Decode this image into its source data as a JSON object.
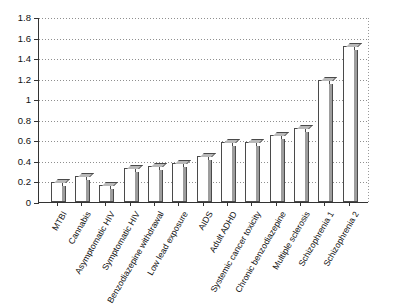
{
  "chart_data": {
    "type": "bar",
    "title": "",
    "xlabel": "",
    "ylabel": "",
    "ylim": [
      0,
      1.8
    ],
    "yticks": [
      "0",
      "0.2",
      "0.4",
      "0.6",
      "0.8",
      "1",
      "1.2",
      "1.4",
      "1.6",
      "1.8"
    ],
    "ytick_values": [
      0,
      0.2,
      0.4,
      0.6,
      0.8,
      1,
      1.2,
      1.4,
      1.6,
      1.8
    ],
    "grid": true,
    "legend": "none",
    "categories": [
      "MTBI",
      "Cannabis",
      "Asymptomatic HIV",
      "Symptomatic HIV",
      "Benzodiazepine withdrawal",
      "Low lead exposure",
      "AIDS",
      "Adult ADHD",
      "Systemic cancer toxicity",
      "Chronic benzodiazepine",
      "Multiple sclerosis",
      "Schizophrenia 1",
      "Schizophrenia 2"
    ],
    "values": [
      0.19,
      0.25,
      0.17,
      0.33,
      0.35,
      0.38,
      0.45,
      0.58,
      0.58,
      0.65,
      0.72,
      1.19,
      1.52
    ],
    "bars": [
      {
        "label": "MTBI",
        "value": 0.19
      },
      {
        "label": "Cannabis",
        "value": 0.25
      },
      {
        "label": "Asymptomatic HIV",
        "value": 0.17
      },
      {
        "label": "Symptomatic HIV",
        "value": 0.33
      },
      {
        "label": "Benzodiazepine withdrawal",
        "value": 0.35
      },
      {
        "label": "Low lead exposure",
        "value": 0.38
      },
      {
        "label": "AIDS",
        "value": 0.45
      },
      {
        "label": "Adult ADHD",
        "value": 0.58
      },
      {
        "label": "Systemic cancer toxicity",
        "value": 0.58
      },
      {
        "label": "Chronic benzodiazepine",
        "value": 0.65
      },
      {
        "label": "Multiple sclerosis",
        "value": 0.72
      },
      {
        "label": "Schizophrenia 1",
        "value": 1.19
      },
      {
        "label": "Schizophrenia 2",
        "value": 1.52
      }
    ],
    "bar_count": 13,
    "colors": {
      "bar_face": "#ffffff",
      "bar_edge": "#4a4a4a",
      "bar_side": "#9d9d9d",
      "bar_top": "#b9b9b9",
      "gridline": "#8f8f8f",
      "axis": "#333333",
      "background": "#ffffff",
      "text": "#111111"
    }
  }
}
